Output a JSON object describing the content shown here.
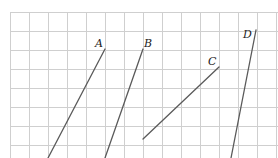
{
  "diagram": {
    "type": "graph-paper-lines",
    "grid": {
      "origin_x": 10,
      "origin_y": 12,
      "cell": 19,
      "cols": 14,
      "rows": 8,
      "color": "#cfcfcf"
    },
    "line_color": "#5a5a5a",
    "segments": [
      {
        "label": "A",
        "x1": 105,
        "y1": 49,
        "x2": 48,
        "y2": 158,
        "label_x": 95,
        "label_y": 47
      },
      {
        "label": "B",
        "x1": 143,
        "y1": 49,
        "x2": 105,
        "y2": 158,
        "label_x": 144,
        "label_y": 47
      },
      {
        "label": "C",
        "x1": 219,
        "y1": 67,
        "x2": 143,
        "y2": 139,
        "label_x": 208,
        "label_y": 65
      },
      {
        "label": "D",
        "x1": 256,
        "y1": 30,
        "x2": 231,
        "y2": 158,
        "label_x": 243,
        "label_y": 38
      }
    ]
  }
}
